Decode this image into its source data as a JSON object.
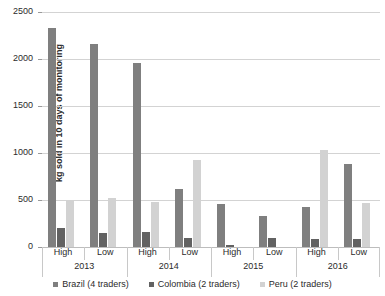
{
  "chart_data": {
    "type": "bar",
    "title": "",
    "xlabel": "",
    "ylabel": "kg sold in 10 days of monitoring",
    "ylim": [
      0,
      2500
    ],
    "yticks": [
      0,
      500,
      1000,
      1500,
      2000,
      2500
    ],
    "ytick_labels": [
      "0",
      "500",
      "1000",
      "1500",
      "2000",
      "2500"
    ],
    "grid": true,
    "legend_position": "bottom",
    "categories": [
      "High",
      "Low",
      "High",
      "Low",
      "High",
      "Low",
      "High",
      "Low"
    ],
    "groups": [
      {
        "label": "2013",
        "categories": [
          "High",
          "Low"
        ]
      },
      {
        "label": "2014",
        "categories": [
          "High",
          "Low"
        ]
      },
      {
        "label": "2015",
        "categories": [
          "High",
          "Low"
        ]
      },
      {
        "label": "2016",
        "categories": [
          "High",
          "Low"
        ]
      }
    ],
    "series": [
      {
        "name": "Brazil (4 traders)",
        "color": "#7f7f7f",
        "values": [
          2330,
          2160,
          1960,
          620,
          455,
          330,
          424,
          880
        ]
      },
      {
        "name": "Colombia (2 traders)",
        "color": "#626262",
        "values": [
          200,
          150,
          163,
          98,
          22,
          100,
          85,
          90
        ]
      },
      {
        "name": "Peru (2 traders)",
        "color": "#d2d2d2",
        "values": [
          505,
          520,
          478,
          925,
          0,
          0,
          1030,
          470
        ]
      }
    ]
  },
  "legend": {
    "items": [
      {
        "label": "Brazil (4 traders)"
      },
      {
        "label": "Colombia (2 traders)"
      },
      {
        "label": "Peru (2 traders)"
      }
    ]
  }
}
